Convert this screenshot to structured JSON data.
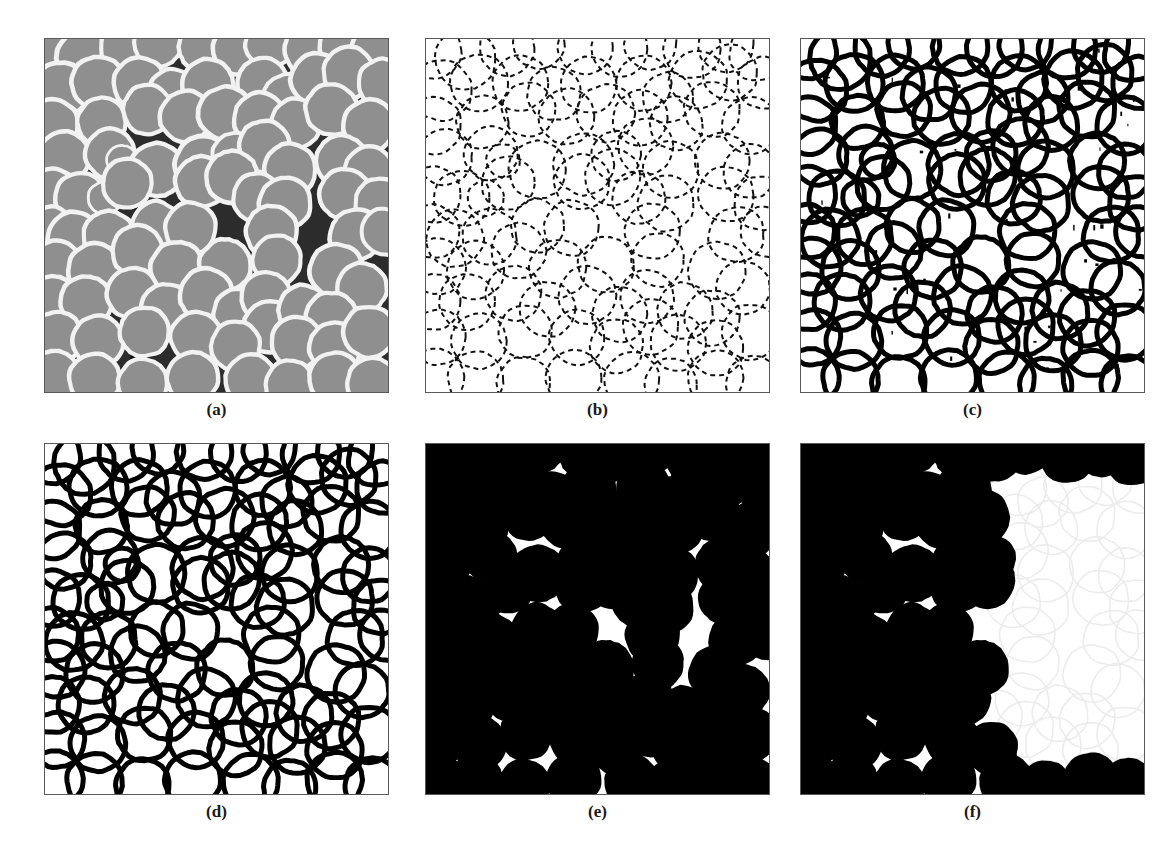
{
  "figure": {
    "type": "multi-panel-image-processing-figure",
    "background_color": "#ffffff",
    "panel_border_color": "#5a5a5a",
    "rows": 2,
    "cols": 3,
    "panels": [
      {
        "id": "a",
        "label": "(a)",
        "caption_text": "(a)",
        "kind": "sem-grayscale-micrograph",
        "description": "Original SEM grayscale micrograph of spherical latex particles on dark substrate",
        "colors": {
          "background": "#2c2c2c",
          "particle_fill": "#8f8f8f",
          "particle_rim": "#f2f2f2",
          "dark_void": "#0a0a0a"
        },
        "x": 44,
        "y": 38,
        "w": 345,
        "h": 355
      },
      {
        "id": "b",
        "label": "(b)",
        "caption_text": "(b)",
        "kind": "edge-map-thin-broken",
        "description": "Thin, broken/dashed edge detection result on white background",
        "colors": {
          "background": "#ffffff",
          "edge": "#111111"
        },
        "stroke_width": 2.0,
        "dash": "5 4",
        "x": 425,
        "y": 38,
        "w": 345,
        "h": 355
      },
      {
        "id": "c",
        "label": "(c)",
        "caption_text": "(c)",
        "kind": "edge-map-thick-noisy",
        "description": "Thick continuous contours with residual speckle noise",
        "colors": {
          "background": "#ffffff",
          "edge": "#000000",
          "noise": "#000000"
        },
        "stroke_width": 5.0,
        "noise_specks": 46,
        "x": 800,
        "y": 38,
        "w": 345,
        "h": 355
      },
      {
        "id": "d",
        "label": "(d)",
        "caption_text": "(d)",
        "kind": "edge-map-thick-denoised",
        "description": "Thick continuous contours after noise removal / morphological cleanup",
        "colors": {
          "background": "#ffffff",
          "edge": "#000000"
        },
        "stroke_width": 5.0,
        "noise_specks": 0,
        "x": 44,
        "y": 443,
        "w": 345,
        "h": 352
      },
      {
        "id": "e",
        "label": "(e)",
        "caption_text": "(e)",
        "kind": "binary-filled-mask",
        "description": "Binary mask after hole filling: solid black particles on white",
        "colors": {
          "background": "#ffffff",
          "particle": "#000000"
        },
        "x": 425,
        "y": 443,
        "w": 345,
        "h": 352
      },
      {
        "id": "f",
        "label": "(f)",
        "caption_text": "(f)",
        "kind": "binary-mask-border-cleared",
        "description": "Binary mask with right-hand region suppressed / border objects cleared, leaving ghost outlines",
        "colors": {
          "background": "#ffffff",
          "particle": "#000000",
          "ghost_outline": "#ececec"
        },
        "ghost_region_x_fraction": 0.56,
        "x": 800,
        "y": 443,
        "w": 345,
        "h": 352
      }
    ],
    "label_style": {
      "font_weight": "bold",
      "font_size_px": 17,
      "color": "#1a1a1a"
    },
    "particles": [
      {
        "x": 0.02,
        "y": 0.03,
        "r": 0.052
      },
      {
        "x": 0.115,
        "y": 0.055,
        "r": 0.055
      },
      {
        "x": 0.235,
        "y": 0.025,
        "r": 0.05
      },
      {
        "x": 0.33,
        "y": 0.01,
        "r": 0.047
      },
      {
        "x": 0.465,
        "y": 0.022,
        "r": 0.05
      },
      {
        "x": 0.565,
        "y": 0.03,
        "r": 0.05
      },
      {
        "x": 0.655,
        "y": 0.012,
        "r": 0.047
      },
      {
        "x": 0.775,
        "y": 0.03,
        "r": 0.052
      },
      {
        "x": 0.875,
        "y": 0.015,
        "r": 0.05
      },
      {
        "x": 0.965,
        "y": 0.04,
        "r": 0.05
      },
      {
        "x": 0.045,
        "y": 0.145,
        "r": 0.055
      },
      {
        "x": 0.155,
        "y": 0.125,
        "r": 0.052
      },
      {
        "x": 0.275,
        "y": 0.125,
        "r": 0.05
      },
      {
        "x": 0.375,
        "y": 0.155,
        "r": 0.048
      },
      {
        "x": 0.475,
        "y": 0.13,
        "r": 0.05
      },
      {
        "x": 0.635,
        "y": 0.125,
        "r": 0.05
      },
      {
        "x": 0.705,
        "y": 0.165,
        "r": 0.045
      },
      {
        "x": 0.795,
        "y": 0.115,
        "r": 0.052
      },
      {
        "x": 0.885,
        "y": 0.095,
        "r": 0.05
      },
      {
        "x": 0.985,
        "y": 0.125,
        "r": 0.047
      },
      {
        "x": 0.02,
        "y": 0.245,
        "r": 0.052
      },
      {
        "x": 0.165,
        "y": 0.235,
        "r": 0.047
      },
      {
        "x": 0.3,
        "y": 0.2,
        "r": 0.048
      },
      {
        "x": 0.41,
        "y": 0.22,
        "r": 0.05
      },
      {
        "x": 0.525,
        "y": 0.21,
        "r": 0.052
      },
      {
        "x": 0.625,
        "y": 0.225,
        "r": 0.05
      },
      {
        "x": 0.73,
        "y": 0.24,
        "r": 0.048
      },
      {
        "x": 0.835,
        "y": 0.2,
        "r": 0.05
      },
      {
        "x": 0.945,
        "y": 0.245,
        "r": 0.05
      },
      {
        "x": 0.055,
        "y": 0.335,
        "r": 0.05
      },
      {
        "x": 0.19,
        "y": 0.325,
        "r": 0.048
      },
      {
        "x": 0.225,
        "y": 0.345,
        "r": 0.03
      },
      {
        "x": 0.325,
        "y": 0.37,
        "r": 0.052
      },
      {
        "x": 0.46,
        "y": 0.355,
        "r": 0.055
      },
      {
        "x": 0.555,
        "y": 0.33,
        "r": 0.045
      },
      {
        "x": 0.64,
        "y": 0.305,
        "r": 0.05
      },
      {
        "x": 0.715,
        "y": 0.37,
        "r": 0.05
      },
      {
        "x": 0.865,
        "y": 0.345,
        "r": 0.05
      },
      {
        "x": 0.945,
        "y": 0.375,
        "r": 0.048
      },
      {
        "x": 0.02,
        "y": 0.44,
        "r": 0.05
      },
      {
        "x": 0.105,
        "y": 0.45,
        "r": 0.05
      },
      {
        "x": 0.175,
        "y": 0.45,
        "r": 0.032
      },
      {
        "x": 0.24,
        "y": 0.41,
        "r": 0.048
      },
      {
        "x": 0.455,
        "y": 0.405,
        "r": 0.05
      },
      {
        "x": 0.545,
        "y": 0.39,
        "r": 0.05
      },
      {
        "x": 0.62,
        "y": 0.45,
        "r": 0.048
      },
      {
        "x": 0.7,
        "y": 0.465,
        "r": 0.05
      },
      {
        "x": 0.875,
        "y": 0.44,
        "r": 0.05
      },
      {
        "x": 0.975,
        "y": 0.465,
        "r": 0.048
      },
      {
        "x": 0.02,
        "y": 0.545,
        "r": 0.048
      },
      {
        "x": 0.085,
        "y": 0.565,
        "r": 0.052
      },
      {
        "x": 0.185,
        "y": 0.56,
        "r": 0.05
      },
      {
        "x": 0.325,
        "y": 0.53,
        "r": 0.048
      },
      {
        "x": 0.425,
        "y": 0.535,
        "r": 0.05
      },
      {
        "x": 0.66,
        "y": 0.545,
        "r": 0.05
      },
      {
        "x": 0.905,
        "y": 0.555,
        "r": 0.05
      },
      {
        "x": 0.99,
        "y": 0.545,
        "r": 0.045
      },
      {
        "x": 0.035,
        "y": 0.645,
        "r": 0.05
      },
      {
        "x": 0.145,
        "y": 0.655,
        "r": 0.052
      },
      {
        "x": 0.27,
        "y": 0.6,
        "r": 0.05
      },
      {
        "x": 0.385,
        "y": 0.65,
        "r": 0.052
      },
      {
        "x": 0.525,
        "y": 0.64,
        "r": 0.05
      },
      {
        "x": 0.675,
        "y": 0.625,
        "r": 0.048
      },
      {
        "x": 0.85,
        "y": 0.655,
        "r": 0.052
      },
      {
        "x": 0.925,
        "y": 0.705,
        "r": 0.048
      },
      {
        "x": 0.02,
        "y": 0.745,
        "r": 0.05
      },
      {
        "x": 0.12,
        "y": 0.745,
        "r": 0.05
      },
      {
        "x": 0.255,
        "y": 0.72,
        "r": 0.05
      },
      {
        "x": 0.355,
        "y": 0.765,
        "r": 0.05
      },
      {
        "x": 0.47,
        "y": 0.725,
        "r": 0.052
      },
      {
        "x": 0.565,
        "y": 0.78,
        "r": 0.05
      },
      {
        "x": 0.645,
        "y": 0.73,
        "r": 0.048
      },
      {
        "x": 0.655,
        "y": 0.815,
        "r": 0.05
      },
      {
        "x": 0.755,
        "y": 0.77,
        "r": 0.05
      },
      {
        "x": 0.835,
        "y": 0.79,
        "r": 0.05
      },
      {
        "x": 0.035,
        "y": 0.845,
        "r": 0.05
      },
      {
        "x": 0.155,
        "y": 0.855,
        "r": 0.05
      },
      {
        "x": 0.29,
        "y": 0.83,
        "r": 0.048
      },
      {
        "x": 0.44,
        "y": 0.845,
        "r": 0.05
      },
      {
        "x": 0.555,
        "y": 0.87,
        "r": 0.048
      },
      {
        "x": 0.735,
        "y": 0.86,
        "r": 0.05
      },
      {
        "x": 0.845,
        "y": 0.875,
        "r": 0.05
      },
      {
        "x": 0.945,
        "y": 0.83,
        "r": 0.05
      },
      {
        "x": 0.03,
        "y": 0.955,
        "r": 0.05
      },
      {
        "x": 0.145,
        "y": 0.965,
        "r": 0.05
      },
      {
        "x": 0.285,
        "y": 0.975,
        "r": 0.048
      },
      {
        "x": 0.43,
        "y": 0.96,
        "r": 0.05
      },
      {
        "x": 0.6,
        "y": 0.965,
        "r": 0.05
      },
      {
        "x": 0.715,
        "y": 0.98,
        "r": 0.048
      },
      {
        "x": 0.845,
        "y": 0.96,
        "r": 0.05
      },
      {
        "x": 0.955,
        "y": 0.975,
        "r": 0.05
      }
    ]
  }
}
